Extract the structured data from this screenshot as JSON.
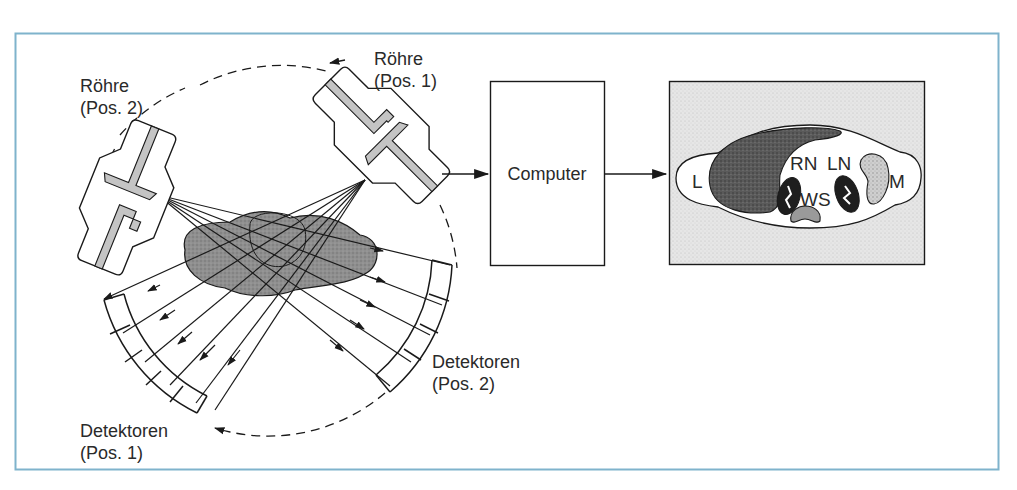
{
  "figure": {
    "frame_color": "#7fb3cc",
    "ink_color": "#1a1a1a",
    "tube_fill": "#c8c8c8",
    "object_fill": "#8c8c8c",
    "image_bg": "#e4e4e4"
  },
  "labels": {
    "tube_pos2": {
      "line1": "Röhre",
      "line2": "(Pos. 2)"
    },
    "tube_pos1": {
      "line1": "Röhre",
      "line2": "(Pos. 1)"
    },
    "detectors_pos1": {
      "line1": "Detektoren",
      "line2": "(Pos. 1)"
    },
    "detectors_pos2": {
      "line1": "Detektoren",
      "line2": "(Pos. 2)"
    },
    "computer": "Computer"
  },
  "ct_image": {
    "organs": {
      "liver": "L",
      "right_kidney": "RN",
      "left_kidney": "LN",
      "spine": "WS",
      "spleen": "M"
    }
  }
}
